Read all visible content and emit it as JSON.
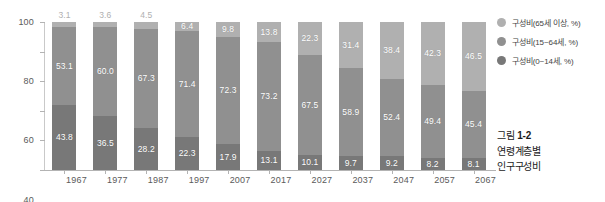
{
  "chart_data": {
    "type": "bar",
    "subtype": "stacked-percentage",
    "title": "",
    "xlabel": "",
    "ylabel": "",
    "ylim": [
      0,
      100
    ],
    "yticks": [
      0,
      20,
      40,
      60,
      80,
      100
    ],
    "grid": false,
    "legend_position": "right-top",
    "categories": [
      "1967",
      "1977",
      "1987",
      "1997",
      "2007",
      "2017",
      "2027",
      "2037",
      "2047",
      "2057",
      "2067"
    ],
    "series": [
      {
        "name": "구성비(65세 이상, %)",
        "key": "elder",
        "color": "#b0b0b0",
        "values": [
          3.1,
          3.6,
          4.5,
          6.4,
          9.8,
          13.8,
          22.3,
          31.4,
          38.4,
          42.3,
          46.5
        ],
        "label_placement": [
          "outside",
          "outside",
          "outside",
          "inside",
          "inside",
          "inside",
          "inside",
          "inside",
          "inside",
          "inside",
          "inside"
        ]
      },
      {
        "name": "구성비(15~64세, %)",
        "key": "work",
        "color": "#909090",
        "values": [
          53.1,
          60.0,
          67.3,
          71.4,
          72.3,
          73.2,
          67.5,
          58.9,
          52.4,
          49.4,
          45.4
        ],
        "label_placement": [
          "inside",
          "inside",
          "inside",
          "inside",
          "inside",
          "inside",
          "inside",
          "inside",
          "inside",
          "inside",
          "inside"
        ]
      },
      {
        "name": "구성비(0~14세, %)",
        "key": "child",
        "color": "#787878",
        "values": [
          43.8,
          36.5,
          28.2,
          22.3,
          17.9,
          13.1,
          10.1,
          9.7,
          9.2,
          8.2,
          8.1
        ],
        "label_placement": [
          "inside",
          "inside",
          "inside",
          "inside",
          "inside",
          "inside",
          "inside",
          "inside",
          "inside",
          "inside",
          "inside"
        ]
      }
    ]
  },
  "axis": {
    "y_tick_labels": [
      "0",
      "20",
      "40",
      "60",
      "80",
      "100"
    ],
    "x_tick_labels": [
      "1967",
      "1977",
      "1987",
      "1997",
      "2007",
      "2017",
      "2027",
      "2037",
      "2047",
      "2057",
      "2067"
    ]
  },
  "legend": {
    "items": [
      {
        "label": "구성비(65세 이상, %)",
        "color": "#b0b0b0"
      },
      {
        "label": "구성비(15~64세, %)",
        "color": "#909090"
      },
      {
        "label": "구성비(0~14세, %)",
        "color": "#787878"
      }
    ]
  },
  "caption": {
    "prefix": "그림",
    "number": "1-2",
    "line1": "연령계층별",
    "line2": "인구구성비"
  }
}
